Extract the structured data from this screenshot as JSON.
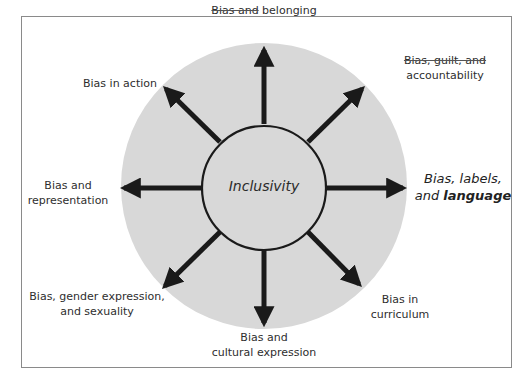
{
  "diagram": {
    "center": {
      "label": "Inclusivity"
    },
    "colors": {
      "outer_circle": "#d8d8d8",
      "inner_circle": "#d8d8d8",
      "arrows": "#1a1a1a",
      "frame_border": "#8a8a8a"
    },
    "spokes": [
      {
        "id": "top",
        "direction": "up",
        "line1_struck": "Bias and",
        "line1_rest": " belonging"
      },
      {
        "id": "top-right",
        "direction": "up-right",
        "line1": "Bias, guilt, and",
        "line2": "accountability",
        "struck": true
      },
      {
        "id": "right",
        "direction": "right",
        "line1": "Bias, labels,",
        "line2_prefix": "and ",
        "line2_bold": "language",
        "emphasized": true
      },
      {
        "id": "bottom-right",
        "direction": "down-right",
        "line1": "Bias in",
        "line2": "curriculum"
      },
      {
        "id": "bottom",
        "direction": "down",
        "line1": "Bias and",
        "line2": "cultural expression"
      },
      {
        "id": "bottom-left",
        "direction": "down-left",
        "line1": "Bias, gender expression,",
        "line2": "and sexuality"
      },
      {
        "id": "left",
        "direction": "left",
        "line1": "Bias and",
        "line2": "representation"
      },
      {
        "id": "top-left",
        "direction": "up-left",
        "line1": "Bias in action"
      }
    ]
  }
}
